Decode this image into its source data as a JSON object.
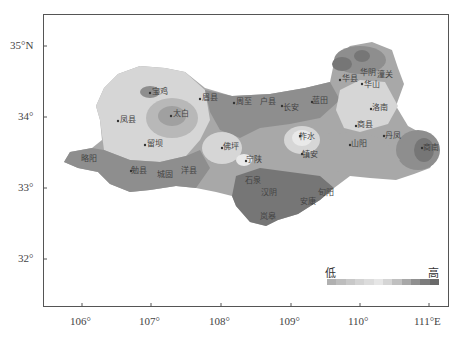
{
  "map": {
    "axes": {
      "lat_ticks": [
        {
          "label": "35°N",
          "y": 46
        },
        {
          "label": "34°",
          "y": 117
        },
        {
          "label": "33°",
          "y": 188
        },
        {
          "label": "32°",
          "y": 259
        }
      ],
      "lon_ticks": [
        {
          "label": "106°",
          "x": 82
        },
        {
          "label": "107°",
          "x": 151
        },
        {
          "label": "108°",
          "x": 221
        },
        {
          "label": "109°",
          "x": 291
        },
        {
          "label": "110°",
          "x": 360
        },
        {
          "label": "111°E",
          "x": 429
        }
      ]
    },
    "cities": [
      {
        "name": "宝鸡",
        "x": 150,
        "y": 93
      },
      {
        "name": "眉县",
        "x": 200,
        "y": 99
      },
      {
        "name": "太白",
        "x": 171,
        "y": 116
      },
      {
        "name": "凤县",
        "x": 118,
        "y": 121
      },
      {
        "name": "留坝",
        "x": 145,
        "y": 145
      },
      {
        "name": "周至",
        "x": 234,
        "y": 103
      },
      {
        "name": "户县",
        "x": 262,
        "y": 103
      },
      {
        "name": "长安",
        "x": 282,
        "y": 106
      },
      {
        "name": "蓝田",
        "x": 312,
        "y": 102
      },
      {
        "name": "华县",
        "x": 340,
        "y": 80
      },
      {
        "name": "华阴",
        "x": 360,
        "y": 74
      },
      {
        "name": "潼关",
        "x": 376,
        "y": 76
      },
      {
        "name": "华山",
        "x": 362,
        "y": 84
      },
      {
        "name": "洛南",
        "x": 371,
        "y": 109
      },
      {
        "name": "商县",
        "x": 356,
        "y": 126
      },
      {
        "name": "柞水",
        "x": 300,
        "y": 136
      },
      {
        "name": "镇安",
        "x": 302,
        "y": 154
      },
      {
        "name": "山阳",
        "x": 350,
        "y": 145
      },
      {
        "name": "丹凤",
        "x": 384,
        "y": 136
      },
      {
        "name": "商南",
        "x": 422,
        "y": 148
      },
      {
        "name": "佛坪",
        "x": 222,
        "y": 148
      },
      {
        "name": "宁陕",
        "x": 246,
        "y": 161
      },
      {
        "name": "略阳",
        "x": 80,
        "y": 160
      },
      {
        "name": "勉县",
        "x": 131,
        "y": 171
      },
      {
        "name": "城固",
        "x": 157,
        "y": 175
      },
      {
        "name": "洋县",
        "x": 181,
        "y": 171
      },
      {
        "name": "石泉",
        "x": 245,
        "y": 181
      },
      {
        "name": "汉阴",
        "x": 262,
        "y": 193
      },
      {
        "name": "旬阳",
        "x": 322,
        "y": 193
      },
      {
        "name": "安康",
        "x": 300,
        "y": 202
      },
      {
        "name": "岚皋",
        "x": 262,
        "y": 215
      }
    ],
    "legend": {
      "low_label": "低",
      "high_label": "高",
      "colors": [
        "#b0b0b0",
        "#bdbdbd",
        "#c8c8c8",
        "#d3d3d3",
        "#dcdcdc",
        "#e6e6e6",
        "#d5d5d5",
        "#c0c0c0",
        "#a8a8a8",
        "#909090",
        "#7c7c7c",
        "#6a6a6a"
      ]
    },
    "shade_colors": {
      "lightest": "#e9e9e9",
      "light": "#d6d6d6",
      "mid_light": "#c2c2c2",
      "mid": "#a8a8a8",
      "dark": "#8e8e8e",
      "darkest": "#767676"
    }
  }
}
